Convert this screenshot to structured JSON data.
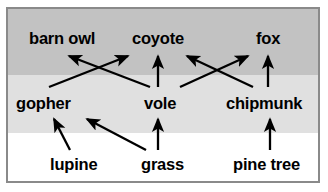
{
  "figure": {
    "name": "food-web-diagram"
  },
  "frame": {
    "border_color": "#8a8a8a",
    "background_color": "#ffffff"
  },
  "bands": [
    {
      "id": "top",
      "label": "predators-band",
      "color": "#c2c2c2"
    },
    {
      "id": "middle",
      "label": "consumers-band",
      "color": "#e0e0e0"
    },
    {
      "id": "bottom",
      "label": "producers-band",
      "color": "#ffffff"
    }
  ],
  "organisms": {
    "barn_owl": "barn owl",
    "coyote": "coyote",
    "fox": "fox",
    "gopher": "gopher",
    "vole": "vole",
    "chipmunk": "chipmunk",
    "lupine": "lupine",
    "grass": "grass",
    "pine_tree": "pine tree"
  },
  "tiers": [
    {
      "name": "predators",
      "members": [
        "barn owl",
        "coyote",
        "fox"
      ]
    },
    {
      "name": "consumers",
      "members": [
        "gopher",
        "vole",
        "chipmunk"
      ]
    },
    {
      "name": "producers",
      "members": [
        "lupine",
        "grass",
        "pine tree"
      ]
    }
  ],
  "arrows": [
    {
      "name": "vole-to-barn-owl",
      "from": "vole",
      "to": "barn owl"
    },
    {
      "name": "gopher-to-coyote",
      "from": "gopher",
      "to": "coyote"
    },
    {
      "name": "vole-to-coyote",
      "from": "vole",
      "to": "coyote"
    },
    {
      "name": "chipmunk-to-coyote",
      "from": "chipmunk",
      "to": "coyote"
    },
    {
      "name": "vole-to-fox",
      "from": "vole",
      "to": "fox"
    },
    {
      "name": "chipmunk-to-fox",
      "from": "chipmunk",
      "to": "fox"
    },
    {
      "name": "lupine-to-gopher",
      "from": "lupine",
      "to": "gopher"
    },
    {
      "name": "grass-to-gopher",
      "from": "grass",
      "to": "gopher"
    },
    {
      "name": "grass-to-vole",
      "from": "grass",
      "to": "vole"
    },
    {
      "name": "pine-tree-to-chipmunk",
      "from": "pine tree",
      "to": "chipmunk"
    }
  ],
  "style": {
    "arrow_color": "#000000",
    "text_color": "#000000"
  }
}
